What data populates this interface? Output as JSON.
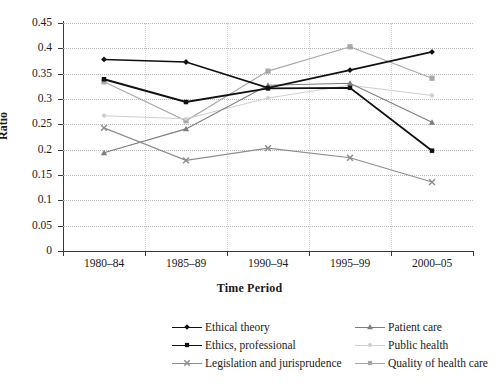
{
  "chart_data": {
    "type": "line",
    "title": "",
    "xlabel": "Time Period",
    "ylabel": "Ratio",
    "categories": [
      "1980–84",
      "1985–89",
      "1990–94",
      "1995–99",
      "2000–05"
    ],
    "ylim": [
      0,
      0.45
    ],
    "ytick_labels": [
      "0",
      "0.05",
      "0.1",
      "0.15",
      "0.2",
      "0.25",
      "0.3",
      "0.35",
      "0.4",
      "0.45"
    ],
    "ytick_values": [
      0,
      0.05,
      0.1,
      0.15,
      0.2,
      0.25,
      0.3,
      0.35,
      0.4,
      0.45
    ],
    "grid": true,
    "legend_position": "bottom",
    "series": [
      {
        "name": "Ethical theory",
        "marker": "diamond",
        "color": "#111111",
        "line_width": 1.6,
        "values": [
          0.378,
          0.373,
          0.322,
          0.357,
          0.393
        ]
      },
      {
        "name": "Ethics, professional",
        "marker": "square",
        "color": "#111111",
        "line_width": 1.9,
        "values": [
          0.339,
          0.294,
          0.321,
          0.322,
          0.198
        ]
      },
      {
        "name": "Legislation and jurisprudence",
        "marker": "x",
        "color": "#8d8d8d",
        "line_width": 1.1,
        "values": [
          0.243,
          0.179,
          0.203,
          0.184,
          0.136
        ]
      },
      {
        "name": "Patient care",
        "marker": "triangle",
        "color": "#7d7d7d",
        "line_width": 1.1,
        "values": [
          0.194,
          0.241,
          0.327,
          0.331,
          0.254
        ]
      },
      {
        "name": "Public health",
        "marker": "circle",
        "color": "#cfcfcf",
        "line_width": 1.1,
        "values": [
          0.267,
          0.261,
          0.302,
          0.327,
          0.307
        ]
      },
      {
        "name": "Quality of health care",
        "marker": "square",
        "color": "#a8a8a8",
        "line_width": 1.1,
        "values": [
          0.334,
          0.257,
          0.355,
          0.403,
          0.341
        ]
      }
    ]
  }
}
